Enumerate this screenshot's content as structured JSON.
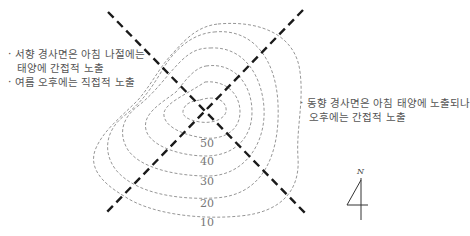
{
  "diagram": {
    "notes": {
      "west": {
        "lines": [
          "· 서향 경사면은 아침 나절에는",
          "태양에 간접적 노출",
          "· 여름 오후에는 직접적 노출"
        ]
      },
      "east": {
        "lines": [
          "· 동향 경사면은 아침 태양에 노출되나",
          "오후에는 간접적 노출"
        ]
      }
    },
    "contours": {
      "labels": [
        "50",
        "40",
        "30",
        "20",
        "10"
      ],
      "stroke_color": "#888888"
    },
    "axes": {
      "stroke_color": "#1a1a1a",
      "style": "dashed"
    },
    "north_arrow": {
      "label": "N"
    }
  }
}
